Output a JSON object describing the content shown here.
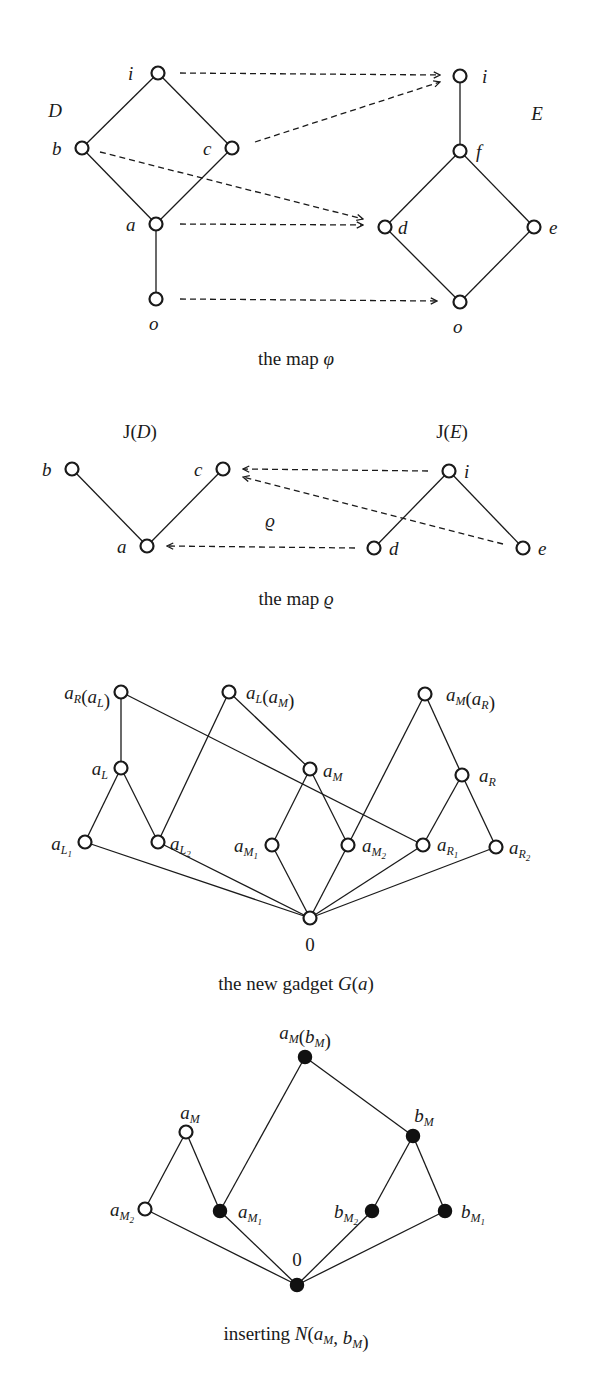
{
  "figures": [
    {
      "id": "map-phi",
      "caption": "the map φ",
      "caption_pos": [
        296,
        365
      ],
      "group_labels": [
        {
          "text": "D",
          "italic": true,
          "x": 55,
          "y": 117
        },
        {
          "text": "E",
          "italic": true,
          "x": 537,
          "y": 120
        }
      ],
      "nodes": [
        {
          "id": "D.i",
          "x": 158,
          "y": 73,
          "filled": false,
          "label": "i",
          "lx": 128,
          "ly": 80
        },
        {
          "id": "D.b",
          "x": 82,
          "y": 148,
          "filled": false,
          "label": "b",
          "lx": 52,
          "ly": 155
        },
        {
          "id": "D.c",
          "x": 232,
          "y": 148,
          "filled": false,
          "label": "c",
          "lx": 203,
          "ly": 155
        },
        {
          "id": "D.a",
          "x": 156,
          "y": 224,
          "filled": false,
          "label": "a",
          "lx": 126,
          "ly": 231
        },
        {
          "id": "D.o",
          "x": 156,
          "y": 299,
          "filled": false,
          "label": "o",
          "lx": 149,
          "ly": 330
        },
        {
          "id": "E.i",
          "x": 460,
          "y": 76,
          "filled": false,
          "label": "i",
          "lx": 482,
          "ly": 83
        },
        {
          "id": "E.f",
          "x": 460,
          "y": 151,
          "filled": false,
          "label": "f",
          "lx": 476,
          "ly": 158
        },
        {
          "id": "E.d",
          "x": 385,
          "y": 227,
          "filled": false,
          "label": "d",
          "lx": 398,
          "ly": 234
        },
        {
          "id": "E.e",
          "x": 534,
          "y": 227,
          "filled": false,
          "label": "e",
          "lx": 549,
          "ly": 234
        },
        {
          "id": "E.o",
          "x": 460,
          "y": 302,
          "filled": false,
          "label": "o",
          "lx": 453,
          "ly": 333
        }
      ],
      "edges": [
        [
          "D.i",
          "D.b"
        ],
        [
          "D.i",
          "D.c"
        ],
        [
          "D.b",
          "D.a"
        ],
        [
          "D.c",
          "D.a"
        ],
        [
          "D.a",
          "D.o"
        ],
        [
          "E.i",
          "E.f"
        ],
        [
          "E.f",
          "E.d"
        ],
        [
          "E.f",
          "E.e"
        ],
        [
          "E.d",
          "E.o"
        ],
        [
          "E.e",
          "E.o"
        ]
      ],
      "arrows": [
        {
          "from": [
            180,
            73
          ],
          "to": [
            440,
            75
          ],
          "desc": "i -> i"
        },
        {
          "from": [
            255,
            142
          ],
          "to": [
            440,
            82
          ],
          "desc": "c -> i"
        },
        {
          "from": [
            100,
            152
          ],
          "to": [
            363,
            219
          ],
          "desc": "b -> d"
        },
        {
          "from": [
            180,
            224
          ],
          "to": [
            363,
            225
          ],
          "desc": "a -> d"
        },
        {
          "from": [
            180,
            299
          ],
          "to": [
            437,
            301
          ],
          "desc": "o -> o"
        }
      ]
    },
    {
      "id": "map-rho",
      "caption": "the map ϱ",
      "caption_pos": [
        296,
        605
      ],
      "group_labels": [
        {
          "text": "J(D)",
          "italic": false,
          "x": 140,
          "y": 438
        },
        {
          "text": "J(E)",
          "italic": false,
          "x": 452,
          "y": 438
        }
      ],
      "inline_labels": [
        {
          "text": "ϱ",
          "x": 270,
          "y": 527
        }
      ],
      "nodes": [
        {
          "id": "JD.b",
          "x": 72,
          "y": 469,
          "filled": false,
          "label": "b",
          "lx": 42,
          "ly": 476
        },
        {
          "id": "JD.c",
          "x": 223,
          "y": 469,
          "filled": false,
          "label": "c",
          "lx": 194,
          "ly": 476
        },
        {
          "id": "JD.a",
          "x": 147,
          "y": 546,
          "filled": false,
          "label": "a",
          "lx": 117,
          "ly": 553
        },
        {
          "id": "JE.i",
          "x": 449,
          "y": 471,
          "filled": false,
          "label": "i",
          "lx": 464,
          "ly": 478
        },
        {
          "id": "JE.d",
          "x": 374,
          "y": 548,
          "filled": false,
          "label": "d",
          "lx": 389,
          "ly": 555
        },
        {
          "id": "JE.e",
          "x": 523,
          "y": 548,
          "filled": false,
          "label": "e",
          "lx": 538,
          "ly": 555
        }
      ],
      "edges": [
        [
          "JD.b",
          "JD.a"
        ],
        [
          "JD.c",
          "JD.a"
        ],
        [
          "JE.i",
          "JE.d"
        ],
        [
          "JE.i",
          "JE.e"
        ]
      ],
      "arrows": [
        {
          "from": [
            428,
            471
          ],
          "to": [
            243,
            469
          ],
          "desc": "i -> c"
        },
        {
          "from": [
            503,
            544
          ],
          "to": [
            243,
            477
          ],
          "desc": "e -> c"
        },
        {
          "from": [
            355,
            548
          ],
          "to": [
            167,
            546
          ],
          "desc": "d -> a"
        }
      ]
    },
    {
      "id": "gadget",
      "caption": "the new gadget G(a)",
      "caption_pos": [
        296,
        990
      ],
      "nodes": [
        {
          "id": "aR(aL)",
          "x": 121,
          "y": 692,
          "filled": false,
          "label": "a_R(a_L)",
          "anchor": "end",
          "lx": 110,
          "ly": 699
        },
        {
          "id": "aL(aM)",
          "x": 229,
          "y": 692,
          "filled": false,
          "label": "a_L(a_M)",
          "anchor": "start",
          "lx": 246,
          "ly": 699
        },
        {
          "id": "aM(aR)",
          "x": 425,
          "y": 694,
          "filled": false,
          "label": "a_M(a_R)",
          "anchor": "start",
          "lx": 446,
          "ly": 701
        },
        {
          "id": "aL",
          "x": 121,
          "y": 768,
          "filled": false,
          "label": "a_L",
          "anchor": "end",
          "lx": 108,
          "ly": 775
        },
        {
          "id": "aM",
          "x": 310,
          "y": 769,
          "filled": false,
          "label": "a_M",
          "anchor": "start",
          "lx": 323,
          "ly": 777
        },
        {
          "id": "aR",
          "x": 462,
          "y": 775,
          "filled": false,
          "label": "a_R",
          "anchor": "start",
          "lx": 479,
          "ly": 782
        },
        {
          "id": "aL1",
          "x": 85,
          "y": 842,
          "filled": false,
          "label": "a_L1",
          "anchor": "end",
          "lx": 72,
          "ly": 850
        },
        {
          "id": "aL2",
          "x": 158,
          "y": 842,
          "filled": false,
          "label": "a_L2",
          "anchor": "start",
          "lx": 170,
          "ly": 850
        },
        {
          "id": "aM1",
          "x": 272,
          "y": 845,
          "filled": false,
          "label": "a_M1",
          "anchor": "end",
          "lx": 258,
          "ly": 852
        },
        {
          "id": "aM2",
          "x": 348,
          "y": 845,
          "filled": false,
          "label": "a_M2",
          "anchor": "start",
          "lx": 362,
          "ly": 852
        },
        {
          "id": "aR1",
          "x": 423,
          "y": 845,
          "filled": false,
          "label": "a_R1",
          "anchor": "start",
          "lx": 437,
          "ly": 851
        },
        {
          "id": "aR2",
          "x": 496,
          "y": 847,
          "filled": false,
          "label": "a_R2",
          "anchor": "start",
          "lx": 509,
          "ly": 854
        },
        {
          "id": "zero",
          "x": 310,
          "y": 918,
          "filled": false,
          "label": "0",
          "anchor": "middle",
          "lx": 310,
          "ly": 951,
          "upright": true
        }
      ],
      "edges": [
        [
          "aR(aL)",
          "aL"
        ],
        [
          "aR(aL)",
          "aR1"
        ],
        [
          "aL(aM)",
          "aL2"
        ],
        [
          "aL(aM)",
          "aM"
        ],
        [
          "aM(aR)",
          "aM2"
        ],
        [
          "aM(aR)",
          "aR"
        ],
        [
          "aL",
          "aL1"
        ],
        [
          "aL",
          "aL2"
        ],
        [
          "aM",
          "aM1"
        ],
        [
          "aM",
          "aM2"
        ],
        [
          "aR",
          "aR1"
        ],
        [
          "aR",
          "aR2"
        ],
        [
          "aL1",
          "zero"
        ],
        [
          "aL2",
          "zero"
        ],
        [
          "aM1",
          "zero"
        ],
        [
          "aM2",
          "zero"
        ],
        [
          "aR1",
          "zero"
        ],
        [
          "aR2",
          "zero"
        ]
      ]
    },
    {
      "id": "inserting",
      "caption": "inserting N(a_M, b_M)",
      "caption_pos": [
        296,
        1340
      ],
      "nodes": [
        {
          "id": "aM(bM)",
          "x": 305,
          "y": 1057,
          "filled": true,
          "label": "a_M(b_M)",
          "anchor": "middle",
          "lx": 305,
          "ly": 1039
        },
        {
          "id": "aM",
          "x": 186,
          "y": 1132,
          "filled": false,
          "label": "a_M",
          "anchor": "middle",
          "lx": 190,
          "ly": 1119
        },
        {
          "id": "bM",
          "x": 413,
          "y": 1136,
          "filled": true,
          "label": "b_M",
          "anchor": "middle",
          "lx": 424,
          "ly": 1122
        },
        {
          "id": "aM2",
          "x": 145,
          "y": 1209,
          "filled": false,
          "label": "a_M2",
          "anchor": "end",
          "lx": 134,
          "ly": 1216
        },
        {
          "id": "aM1",
          "x": 220,
          "y": 1211,
          "filled": true,
          "label": "a_M1",
          "anchor": "start",
          "lx": 238,
          "ly": 1218
        },
        {
          "id": "bM2",
          "x": 372,
          "y": 1211,
          "filled": true,
          "label": "b_M2",
          "anchor": "end",
          "lx": 358,
          "ly": 1218
        },
        {
          "id": "bM1",
          "x": 445,
          "y": 1211,
          "filled": true,
          "label": "b_M1",
          "anchor": "start",
          "lx": 461,
          "ly": 1218
        },
        {
          "id": "zero",
          "x": 297,
          "y": 1285,
          "filled": true,
          "label": "0",
          "anchor": "middle",
          "lx": 297,
          "ly": 1266,
          "upright": true
        }
      ],
      "edges": [
        [
          "aM(bM)",
          "aM1"
        ],
        [
          "aM(bM)",
          "bM"
        ],
        [
          "aM",
          "aM2"
        ],
        [
          "aM",
          "aM1"
        ],
        [
          "bM",
          "bM2"
        ],
        [
          "bM",
          "bM1"
        ],
        [
          "aM2",
          "zero"
        ],
        [
          "aM1",
          "zero"
        ],
        [
          "bM2",
          "zero"
        ],
        [
          "bM1",
          "zero"
        ]
      ]
    }
  ],
  "colors": {
    "ink": "#1a1a1a",
    "background": "#ffffff",
    "filled_node": "#111111"
  }
}
